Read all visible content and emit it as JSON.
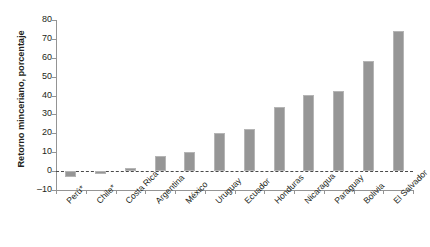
{
  "figure": {
    "clipped_header_text": " "
  },
  "chart_data": {
    "type": "bar",
    "title": "",
    "subtitle": "",
    "xlabel": "",
    "ylabel": "Retorno minceriano, porcentaje",
    "ylim": [
      -10,
      80
    ],
    "ytick_values": [
      80,
      70,
      60,
      50,
      40,
      30,
      20,
      10,
      0,
      -10
    ],
    "ytick_labels": [
      "80",
      "70",
      "60",
      "50",
      "40",
      "30",
      "20",
      "10",
      "0",
      "–10"
    ],
    "grid": false,
    "legend": null,
    "zero_reference_line": {
      "value": 0,
      "style": "dashed"
    },
    "bar_color": "#969696",
    "axis_color": "#949494",
    "categories": [
      "Perú*",
      "Chile*",
      "Costa Rica",
      "Argentina",
      "México",
      "Uruguay",
      "Ecuador",
      "Honduras",
      "Nicaragua",
      "Paraguay",
      "Bolivia",
      "El Salvador"
    ],
    "values": [
      -3.0,
      -1.5,
      1.6,
      8.0,
      10.1,
      20.1,
      22.2,
      34.2,
      40.3,
      42.3,
      58.4,
      74.4
    ],
    "footnote_marker": "*"
  }
}
